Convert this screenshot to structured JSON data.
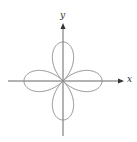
{
  "diagram": {
    "type": "polar-curve",
    "x_axis_label": "x",
    "y_axis_label": "y",
    "petals": 4,
    "petal_directions": [
      "right",
      "up",
      "left",
      "down"
    ],
    "colors": {
      "curve": "#8a8a8a",
      "axes": "#666666",
      "background": "#ffffff"
    }
  }
}
